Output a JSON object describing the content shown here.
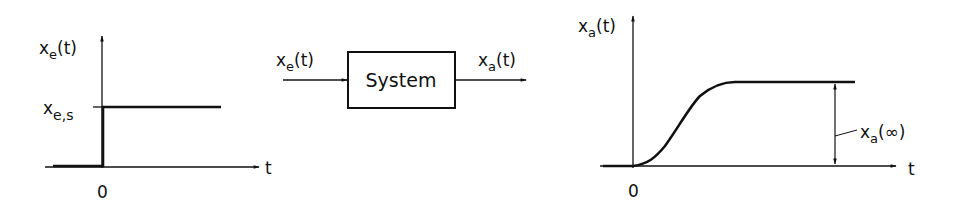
{
  "left_chart": {
    "y_label": "x",
    "y_label_sub": "e",
    "y_label_arg": "(t)",
    "level_label": "x",
    "level_label_sub": "e,s",
    "x_axis_label": "t",
    "origin_label": "0"
  },
  "block": {
    "input_label": "x",
    "input_sub": "e",
    "input_arg": "(t)",
    "box_label": "System",
    "output_label": "x",
    "output_sub": "a",
    "output_arg": "(t)"
  },
  "right_chart": {
    "y_label": "x",
    "y_label_sub": "a",
    "y_label_arg": "(t)",
    "final_value_label": "x",
    "final_value_sub": "a",
    "final_value_arg": "(∞)",
    "x_axis_label": "t",
    "origin_label": "0"
  },
  "colors": {
    "ink": "#111111",
    "background": "#ffffff"
  }
}
